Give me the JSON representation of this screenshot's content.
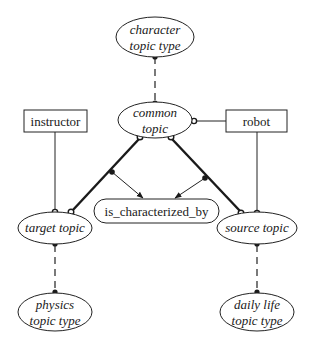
{
  "diagram": {
    "type": "conceptual-graph",
    "nodes": {
      "character_topic_type": {
        "line1": "character",
        "line2": "topic type",
        "shape": "ellipse",
        "style": "italic"
      },
      "common_topic": {
        "line1": "common",
        "line2": "topic",
        "shape": "ellipse",
        "style": "italic"
      },
      "instructor": {
        "label": "instructor",
        "shape": "rectangle"
      },
      "robot": {
        "label": "robot",
        "shape": "rectangle"
      },
      "is_characterized_by": {
        "label": "is_characterized_by",
        "shape": "rounded-pill"
      },
      "target_topic": {
        "label": "target topic",
        "shape": "ellipse",
        "style": "italic"
      },
      "source_topic": {
        "label": "source topic",
        "shape": "ellipse",
        "style": "italic"
      },
      "physics_topic_type": {
        "line1": "physics",
        "line2": "topic type",
        "shape": "ellipse",
        "style": "italic"
      },
      "daily_life_topic_type": {
        "line1": "daily life",
        "line2": "topic type",
        "shape": "ellipse",
        "style": "italic"
      }
    },
    "edges": [
      {
        "from": "character_topic_type",
        "to": "common_topic",
        "style": "dashed",
        "ends": "filled-dot"
      },
      {
        "from": "common_topic",
        "to": "robot",
        "style": "solid",
        "ends": "open-circle"
      },
      {
        "from": "instructor",
        "to": "target_topic",
        "style": "solid",
        "ends": "open-circle"
      },
      {
        "from": "robot",
        "to": "source_topic",
        "style": "solid",
        "ends": "open-circle"
      },
      {
        "from": "common_topic",
        "to": "target_topic",
        "style": "thick",
        "ends": "open-circle"
      },
      {
        "from": "common_topic",
        "to": "source_topic",
        "style": "thick",
        "ends": "open-circle"
      },
      {
        "from": "common_topic-target_topic",
        "to": "is_characterized_by",
        "style": "arrow",
        "ends": "filled-dot"
      },
      {
        "from": "common_topic-source_topic",
        "to": "is_characterized_by",
        "style": "arrow",
        "ends": "filled-dot"
      },
      {
        "from": "target_topic",
        "to": "physics_topic_type",
        "style": "dashed",
        "ends": "filled-dot"
      },
      {
        "from": "source_topic",
        "to": "daily_life_topic_type",
        "style": "dashed",
        "ends": "filled-dot"
      }
    ]
  }
}
